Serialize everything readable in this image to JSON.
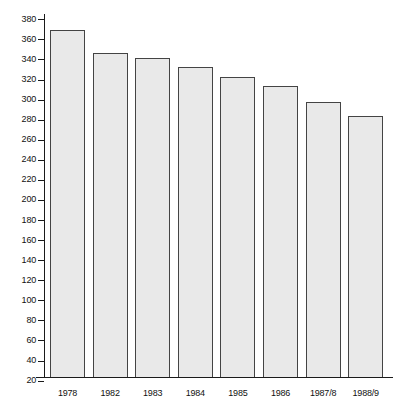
{
  "chart_data": {
    "type": "bar",
    "title": "",
    "subtitle": "",
    "xlabel": "",
    "ylabel": "",
    "categories": [
      "1978",
      "1982",
      "1983",
      "1984",
      "1985",
      "1986",
      "1987/8",
      "1988/9"
    ],
    "values": [
      369,
      346,
      341,
      333,
      323,
      314,
      298,
      284
    ],
    "ylim": [
      0,
      390
    ],
    "y_ticks": [
      20,
      40,
      60,
      80,
      100,
      120,
      140,
      160,
      180,
      200,
      220,
      240,
      260,
      280,
      300,
      320,
      340,
      360,
      380
    ],
    "y_tick_step": 20,
    "grid": false,
    "legend": null,
    "legend_position": "none",
    "annotations": [],
    "series": [
      {
        "name": "",
        "values": [
          369,
          346,
          341,
          333,
          323,
          314,
          298,
          284
        ]
      }
    ]
  },
  "style": {
    "bar_fill": "#e9e9e9",
    "bar_border": "#444444",
    "axis_color": "#1a1a1a",
    "text_color": "#111111",
    "background": "#ffffff"
  }
}
